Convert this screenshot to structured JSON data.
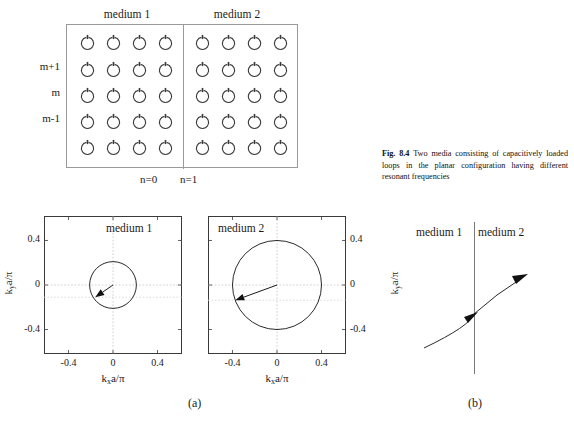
{
  "figure": {
    "caption_label": "Fig. 8.4",
    "caption_text": "Two media consisting of capacitively loaded loops in the planar configuration having different resonant frequencies",
    "subpanel_a": "(a)",
    "subpanel_b": "(b)"
  },
  "lattice": {
    "medium1_label": "medium 1",
    "medium2_label": "medium 2",
    "row_labels": [
      "",
      "m+1",
      "m",
      "m-1",
      ""
    ],
    "col_labels": [
      "n=0",
      "n=1"
    ],
    "rows": 5,
    "cols_medium1": 4,
    "cols_medium2": 4,
    "element_name": "capacitively-loaded-loop",
    "border_color": "#9a9a9a"
  },
  "plots": [
    {
      "title": "medium 1",
      "xlabel": "k a/π",
      "xlabel_sub": "x",
      "ylabel": "k a/π",
      "ylabel_sub": "y",
      "ylabel_side": "left",
      "xticks": [
        "-0.4",
        "0",
        "0.4"
      ],
      "yticks": [
        "0.4",
        "0",
        "-0.4"
      ],
      "circle_radius": 0.21,
      "arrow_angle_deg": 215,
      "arrow_length": 0.195
    },
    {
      "title": "medium 2",
      "xlabel": "k a/π",
      "xlabel_sub": "x",
      "ylabel": "k a/π",
      "ylabel_sub": "y",
      "ylabel_side": "right",
      "xticks": [
        "-0.4",
        "0",
        "0.4"
      ],
      "yticks": [
        "0.4",
        "0",
        "-0.4"
      ],
      "circle_radius": 0.4,
      "arrow_angle_deg": 200,
      "arrow_length": 0.4
    }
  ],
  "chart_data": {
    "type": "scatter",
    "xlabel": "k_x a/π",
    "ylabel": "k_y a/π",
    "xlim": [
      -0.62,
      0.62
    ],
    "ylim": [
      -0.62,
      0.62
    ],
    "xticks": [
      -0.4,
      0,
      0.4
    ],
    "yticks": [
      -0.4,
      0,
      0.4
    ],
    "grid": true,
    "legend": "none",
    "series": [
      {
        "name": "medium 1 isofrequency contour",
        "shape": "circle",
        "center": [
          0,
          0
        ],
        "radius": 0.21,
        "group_velocity_arrow": {
          "from": [
            0,
            0
          ],
          "to": [
            -0.16,
            -0.11
          ]
        }
      },
      {
        "name": "medium 2 isofrequency contour",
        "shape": "circle",
        "center": [
          0,
          0
        ],
        "radius": 0.4,
        "group_velocity_arrow": {
          "from": [
            0,
            0
          ],
          "to": [
            -0.375,
            -0.137
          ]
        }
      }
    ]
  },
  "panel_b": {
    "medium1_label": "medium 1",
    "medium2_label": "medium 2",
    "ray_description": "refracted-ray-crossing-interface"
  },
  "colors": {
    "line": "#2a2a2a",
    "grid": "#bdbdbd",
    "frame": "#3a3a3a",
    "lattice_border": "#9a9a9a",
    "text": "#1a1a1a"
  },
  "footer": {
    "partial_text": ""
  }
}
